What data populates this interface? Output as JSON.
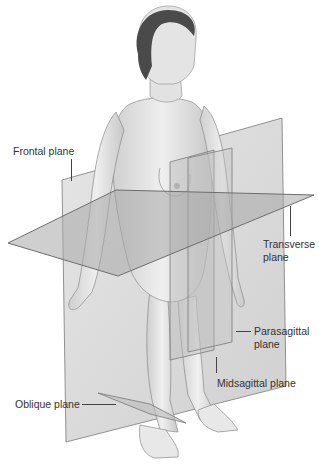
{
  "figure": {
    "labels": {
      "frontal": "Frontal plane",
      "transverse_line1": "Transverse",
      "transverse_line2": "plane",
      "parasagittal_line1": "Parasagittal",
      "parasagittal_line2": "plane",
      "midsagittal": "Midsagittal plane",
      "oblique": "Oblique plane"
    },
    "colors": {
      "background": "#ffffff",
      "plane_fill": "#b9b9b9",
      "plane_edge": "#6e6e6e",
      "skin": "#e6e6e6",
      "skin_shade": "#c9c9c9",
      "hair": "#4a4a4a",
      "label_text": "#333333"
    }
  }
}
